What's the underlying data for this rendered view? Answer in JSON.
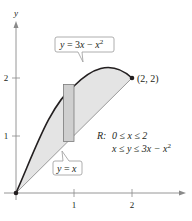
{
  "diagram": {
    "axes": {
      "x_label": "x",
      "y_label": "y",
      "x_ticks": [
        "1",
        "2"
      ],
      "y_ticks": [
        "1",
        "2"
      ]
    },
    "curves": {
      "upper": {
        "label_y": "y",
        "label_eq": " = 3",
        "label_x": "x",
        "label_minus": " − ",
        "label_x2": "x",
        "label_exp": "2"
      },
      "lower": {
        "label_y": "y",
        "label_eq": " = ",
        "label_x": "x"
      }
    },
    "point": {
      "label": "(2, 2)"
    },
    "region": {
      "name": "R:",
      "line1": "0 ≤ x ≤ 2",
      "line2_a": "x ≤ y ≤ 3x − x",
      "line2_exp": "2"
    },
    "colors": {
      "fill": "#e4e4e4",
      "rect_fill": "#cfcfcf",
      "curve": "#231f20",
      "axis": "#8a8a8a",
      "line": "#9a9a9a"
    }
  }
}
